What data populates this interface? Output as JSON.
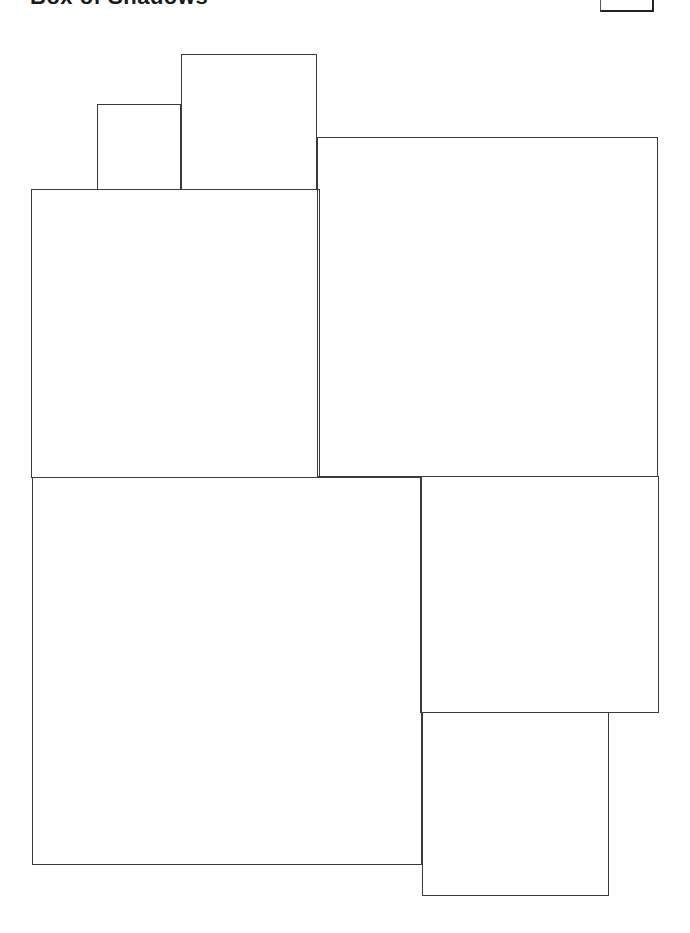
{
  "header": {
    "title": "Box of Shadows",
    "corner_button_label": ""
  },
  "diagram": {
    "stroke_color": "#3a3a3a",
    "background_color": "#ffffff",
    "rectangles": [
      {
        "id": "small-top-left",
        "x": 97,
        "y": 104,
        "w": 84,
        "h": 86
      },
      {
        "id": "tall-top-middle",
        "x": 181,
        "y": 54,
        "w": 136,
        "h": 136
      },
      {
        "id": "upper-left-large",
        "x": 31,
        "y": 189,
        "w": 289,
        "h": 289
      },
      {
        "id": "upper-right-large",
        "x": 317,
        "y": 137,
        "w": 341,
        "h": 340
      },
      {
        "id": "lower-left-large",
        "x": 32,
        "y": 477,
        "w": 390,
        "h": 388
      },
      {
        "id": "lower-right-medium",
        "x": 420,
        "y": 476,
        "w": 239,
        "h": 237
      },
      {
        "id": "bottom-right-small",
        "x": 422,
        "y": 712,
        "w": 187,
        "h": 184
      }
    ]
  }
}
